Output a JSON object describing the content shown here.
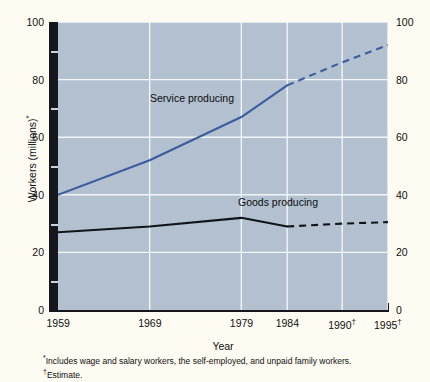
{
  "chart_data": {
    "type": "line",
    "title": "",
    "xlabel": "Year",
    "ylabel": "Workers (millions)*",
    "xlim": [
      1959,
      1995
    ],
    "ylim": [
      0,
      100
    ],
    "grid": true,
    "legend_position": "inline-annotations",
    "y_ticks": [
      0,
      20,
      40,
      60,
      80,
      100
    ],
    "y_ticks_minor": [
      10,
      30,
      50,
      70,
      90
    ],
    "y_tick_labels_left": [
      "0",
      "20",
      "40",
      "60",
      "80",
      "100"
    ],
    "y_tick_labels_right": [
      "0",
      "20",
      "40",
      "60",
      "80",
      "100"
    ],
    "x_ticks": [
      1959,
      1969,
      1979,
      1984,
      1990,
      1995
    ],
    "x_tick_labels": [
      "1959",
      "1969",
      "1979",
      "1984",
      "1990",
      "1995"
    ],
    "x_tick_daggers": [
      false,
      false,
      false,
      false,
      true,
      true
    ],
    "series": [
      {
        "name": "Service producing",
        "color": "#3b5c9e",
        "x": [
          1959,
          1969,
          1979,
          1984,
          1990,
          1995
        ],
        "values": [
          40,
          52,
          67,
          78,
          86,
          92
        ],
        "actual_through": 1984,
        "projected_style": "dashed"
      },
      {
        "name": "Goods producing",
        "color": "#101418",
        "x": [
          1959,
          1969,
          1979,
          1984,
          1990,
          1995
        ],
        "values": [
          27,
          29,
          32,
          29,
          30,
          30.5
        ],
        "actual_through": 1984,
        "projected_style": "dashed"
      }
    ],
    "annotations": [
      {
        "text": "Service producing",
        "series": "Service producing"
      },
      {
        "text": "Goods producing",
        "series": "Goods producing"
      }
    ]
  },
  "footnotes": {
    "marker_star": "*",
    "star_text": "Includes wage and salary workers, the self-employed, and unpaid family workers.",
    "marker_dagger": "†",
    "dagger_text": "Estimate."
  },
  "colors": {
    "page_background": "#fdfbf2",
    "plot_background": "#b2c0d0",
    "gridline": "#f2f5f8",
    "axis_shadow": "#15171c",
    "service_line": "#3b5c9e",
    "goods_line": "#101418"
  }
}
